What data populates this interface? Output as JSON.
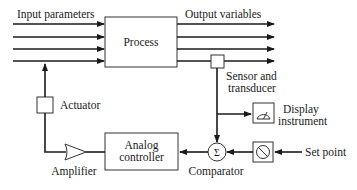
{
  "diagram": {
    "labels": {
      "input_parameters": "Input parameters",
      "output_variables": "Output variables",
      "process": "Process",
      "sensor_line1": "Sensor and",
      "sensor_line2": "transducer",
      "display_line1": "Display",
      "display_line2": "instrument",
      "actuator": "Actuator",
      "analog_line1": "Analog",
      "analog_line2": "controller",
      "amplifier": "Amplifier",
      "comparator": "Comparator",
      "set_point": "Set point",
      "sigma": "Σ"
    },
    "colors": {
      "line": "#1a1a1a",
      "box_border": "#333333",
      "background": "#ffffff"
    }
  }
}
